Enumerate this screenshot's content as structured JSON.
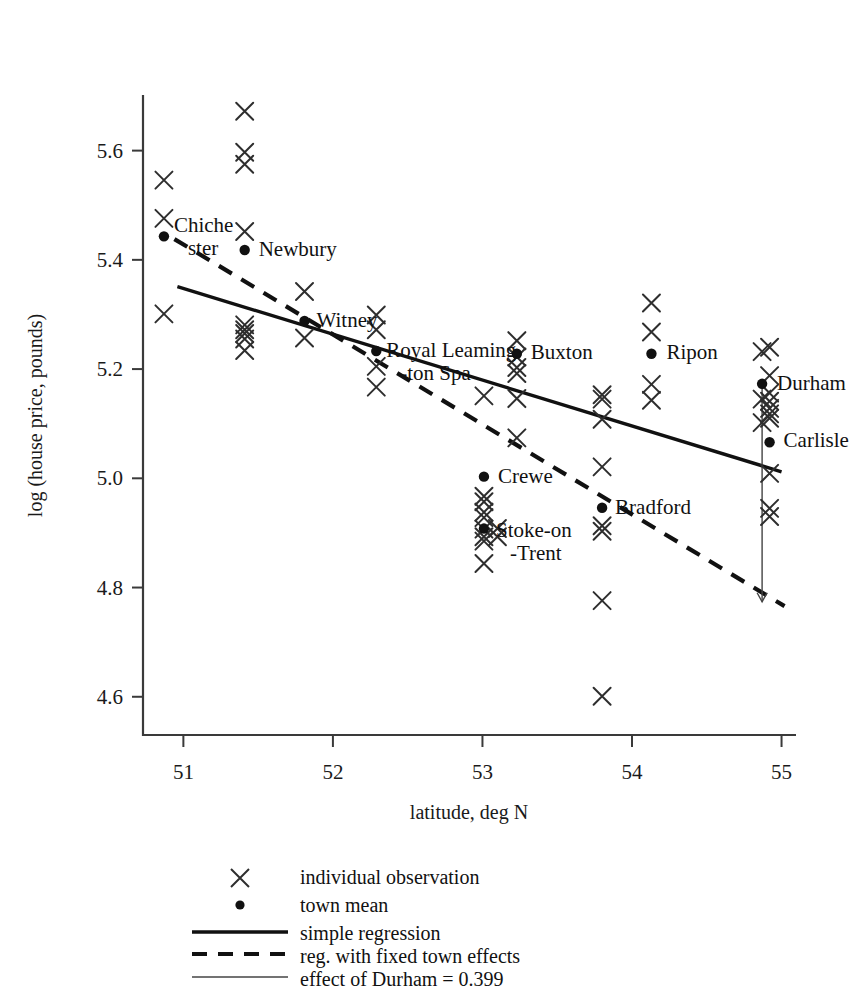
{
  "chart_data": {
    "type": "scatter",
    "title": "",
    "xlabel": "latitude, deg N",
    "ylabel": "log (house price, pounds)",
    "xlim": [
      50.73,
      55.09
    ],
    "ylim": [
      4.53,
      5.7
    ],
    "xticks": [
      "51",
      "52",
      "53",
      "54",
      "55"
    ],
    "xtick_values": [
      51,
      52,
      53,
      54,
      55
    ],
    "yticks": [
      "4.6",
      "4.8",
      "5.0",
      "5.2",
      "5.4",
      "5.6"
    ],
    "ytick_values": [
      4.6,
      4.8,
      5.0,
      5.2,
      5.4,
      5.6
    ],
    "grid": false,
    "legend_position": "below-axes",
    "series": [
      {
        "name": "individual observation",
        "marker": "x",
        "points": [
          [
            50.87,
            5.546
          ],
          [
            50.87,
            5.476
          ],
          [
            50.87,
            5.301
          ],
          [
            51.41,
            5.672
          ],
          [
            51.41,
            5.597
          ],
          [
            51.41,
            5.575
          ],
          [
            51.41,
            5.452
          ],
          [
            51.41,
            5.281
          ],
          [
            51.41,
            5.272
          ],
          [
            51.41,
            5.265
          ],
          [
            51.41,
            5.255
          ],
          [
            51.41,
            5.234
          ],
          [
            51.81,
            5.342
          ],
          [
            51.81,
            5.257
          ],
          [
            52.29,
            5.299
          ],
          [
            52.29,
            5.272
          ],
          [
            52.29,
            5.205
          ],
          [
            52.29,
            5.167
          ],
          [
            53.01,
            5.151
          ],
          [
            53.01,
            4.967
          ],
          [
            53.01,
            4.957
          ],
          [
            53.01,
            4.938
          ],
          [
            53.01,
            4.928
          ],
          [
            53.01,
            4.907
          ],
          [
            53.01,
            4.893
          ],
          [
            53.01,
            4.885
          ],
          [
            53.01,
            4.844
          ],
          [
            53.1,
            4.908
          ],
          [
            53.1,
            4.893
          ],
          [
            53.23,
            5.252
          ],
          [
            53.23,
            5.222
          ],
          [
            53.23,
            5.203
          ],
          [
            53.23,
            5.192
          ],
          [
            53.23,
            5.146
          ],
          [
            53.23,
            5.074
          ],
          [
            53.8,
            5.153
          ],
          [
            53.8,
            5.145
          ],
          [
            53.8,
            5.108
          ],
          [
            53.8,
            5.021
          ],
          [
            53.8,
            4.913
          ],
          [
            53.8,
            4.903
          ],
          [
            53.8,
            4.776
          ],
          [
            53.8,
            4.601
          ],
          [
            54.13,
            5.321
          ],
          [
            54.13,
            5.268
          ],
          [
            54.13,
            5.172
          ],
          [
            54.13,
            5.143
          ],
          [
            54.87,
            5.232
          ],
          [
            54.87,
            5.145
          ],
          [
            54.87,
            5.102
          ],
          [
            54.92,
            5.24
          ],
          [
            54.92,
            5.188
          ],
          [
            54.92,
            5.156
          ],
          [
            54.92,
            5.141
          ],
          [
            54.92,
            5.128
          ],
          [
            54.92,
            5.118
          ],
          [
            54.92,
            5.11
          ],
          [
            54.92,
            5.009
          ],
          [
            54.92,
            4.945
          ],
          [
            54.92,
            4.93
          ]
        ]
      },
      {
        "name": "town mean",
        "marker": "dot",
        "points": [
          {
            "x": 50.87,
            "y": 5.443,
            "label": "Chiche\nster",
            "label_dx": 10,
            "label_dy": -4
          },
          {
            "x": 51.41,
            "y": 5.418,
            "label": "Newbury",
            "label_dx": 14,
            "label_dy": 6
          },
          {
            "x": 51.81,
            "y": 5.288,
            "label": "Witney",
            "label_dx": 12,
            "label_dy": 6
          },
          {
            "x": 52.29,
            "y": 5.233,
            "label": "Royal Leaming\n-ton Spa",
            "label_dx": 10,
            "label_dy": 0
          },
          {
            "x": 53.23,
            "y": 5.228,
            "label": "Buxton",
            "label_dx": 14,
            "label_dy": 5
          },
          {
            "x": 53.01,
            "y": 5.003,
            "label": "Crewe",
            "label_dx": 14,
            "label_dy": 6
          },
          {
            "x": 53.01,
            "y": 4.908,
            "label": "Stoke-on\n-Trent",
            "label_dx": 12,
            "label_dy": 8
          },
          {
            "x": 53.8,
            "y": 4.946,
            "label": "Bradford",
            "label_dx": 13,
            "label_dy": 6
          },
          {
            "x": 54.13,
            "y": 5.228,
            "label": "Ripon",
            "label_dx": 15,
            "label_dy": 5
          },
          {
            "x": 54.87,
            "y": 5.173,
            "label": "Durham",
            "label_dx": 15,
            "label_dy": 6
          },
          {
            "x": 54.92,
            "y": 5.066,
            "label": "Carlisle",
            "label_dx": 14,
            "label_dy": 5
          }
        ]
      }
    ],
    "lines": [
      {
        "name": "simple regression",
        "style": "solid",
        "from": [
          50.96,
          5.351
        ],
        "to": [
          55.0,
          5.012
        ]
      },
      {
        "name": "reg. with fixed town effects",
        "style": "dashed",
        "from": [
          50.94,
          5.438
        ],
        "to": [
          55.02,
          4.766
        ]
      },
      {
        "name": "effect of Durham = 0.399",
        "style": "thin",
        "from": [
          54.87,
          5.173
        ],
        "to": [
          54.87,
          4.774
        ]
      }
    ]
  },
  "legend": {
    "items": [
      {
        "marker": "x",
        "label": "individual observation"
      },
      {
        "marker": "dot",
        "label": "town mean"
      },
      {
        "marker": "solid-line",
        "label": "simple regression"
      },
      {
        "marker": "dashed-line",
        "label": "reg. with fixed town effects"
      },
      {
        "marker": "thin-line",
        "label": "effect of Durham = 0.399"
      }
    ]
  },
  "colors": {
    "ink": "#111111",
    "axis": "#3a3a3a",
    "marker": "#2e2e2e",
    "background": "#ffffff"
  }
}
